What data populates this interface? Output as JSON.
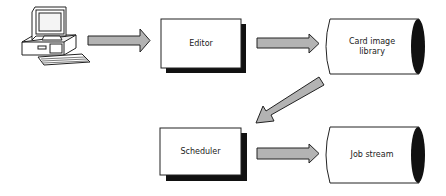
{
  "diagram": {
    "nodes": [
      {
        "id": "terminal",
        "type": "computer",
        "label": ""
      },
      {
        "id": "editor",
        "type": "process",
        "label": "Editor"
      },
      {
        "id": "card_library",
        "type": "storage",
        "label": "Card image library"
      },
      {
        "id": "scheduler",
        "type": "process",
        "label": "Scheduler"
      },
      {
        "id": "job_stream",
        "type": "storage",
        "label": "Job stream"
      }
    ],
    "edges": [
      {
        "from": "terminal",
        "to": "editor"
      },
      {
        "from": "editor",
        "to": "card_library"
      },
      {
        "from": "card_library",
        "to": "scheduler"
      },
      {
        "from": "scheduler",
        "to": "job_stream"
      }
    ]
  },
  "labels": {
    "editor": "Editor",
    "card_library_line1": "Card image",
    "card_library_line2": "library",
    "scheduler": "Scheduler",
    "job_stream": "Job stream"
  },
  "colors": {
    "arrow_fill": "#b3b3b3",
    "outline": "#222222",
    "shadow": "#111111"
  }
}
